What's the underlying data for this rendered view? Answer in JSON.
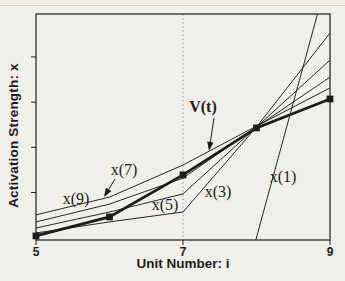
{
  "figure": {
    "background": "#f1efe9",
    "ink": "#1c1c1c",
    "grid_color": "#8a8a8a"
  },
  "chart_data": {
    "type": "line",
    "title": "",
    "xlabel": "Unit Number: i",
    "ylabel": "Activation Strength: x",
    "x_range": [
      5,
      9
    ],
    "y_range": [
      0,
      1
    ],
    "x_ticks": [
      5,
      7,
      9
    ],
    "x_tick_labels": [
      "5",
      "7",
      "9"
    ],
    "y_ticks_unlabeled": [
      0.21,
      0.41,
      0.61,
      0.81
    ],
    "gridline_x": 7,
    "grid": "single dotted vertical line at unit 7",
    "legend_position": "inline labels with leader arrows",
    "series": [
      {
        "name": "x(9)",
        "style": "thin",
        "points": [
          [
            5,
            0.111
          ],
          [
            6,
            0.19
          ],
          [
            7,
            0.332
          ],
          [
            8,
            0.504
          ],
          [
            9,
            0.673
          ]
        ]
      },
      {
        "name": "x(7)",
        "style": "thin",
        "points": [
          [
            5,
            0.08
          ],
          [
            6,
            0.159
          ],
          [
            7,
            0.274
          ],
          [
            8,
            0.5
          ],
          [
            9,
            0.721
          ]
        ]
      },
      {
        "name": "x(5)",
        "style": "thin",
        "points": [
          [
            5,
            0.053
          ],
          [
            6,
            0.124
          ],
          [
            7,
            0.204
          ],
          [
            8,
            0.5
          ],
          [
            9,
            0.796
          ]
        ]
      },
      {
        "name": "x(3)",
        "style": "thin",
        "points": [
          [
            5,
            0.031
          ],
          [
            6,
            0.08
          ],
          [
            7,
            0.124
          ],
          [
            8,
            0.5
          ],
          [
            9,
            0.916
          ]
        ]
      },
      {
        "name": "x(1)",
        "style": "thin",
        "points": [
          [
            7.99,
            0.0
          ],
          [
            8.83,
            1.0
          ]
        ]
      },
      {
        "name": "V(t)",
        "style": "thick",
        "marker": "square",
        "points": [
          [
            5,
            0.018
          ],
          [
            6,
            0.102
          ],
          [
            7,
            0.288
          ],
          [
            8,
            0.496
          ],
          [
            9,
            0.624
          ]
        ]
      }
    ],
    "annotations": [
      {
        "text": "V(t)",
        "x_px": 203,
        "y_px": 107,
        "bold": true,
        "arrow": {
          "x1": 214,
          "y1": 118,
          "x2": 209,
          "y2": 151
        }
      },
      {
        "text": "x(7)",
        "x_px": 124,
        "y_px": 170,
        "arrow": {
          "x1": 115,
          "y1": 179,
          "x2": 104,
          "y2": 197
        }
      },
      {
        "text": "x(9)",
        "x_px": 76,
        "y_px": 199
      },
      {
        "text": "x(5)",
        "x_px": 165,
        "y_px": 205
      },
      {
        "text": "x(3)",
        "x_px": 218,
        "y_px": 192
      },
      {
        "text": "x(1)",
        "x_px": 283,
        "y_px": 177
      }
    ]
  }
}
